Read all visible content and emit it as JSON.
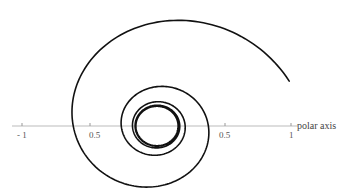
{
  "chart_data": {
    "type": "line",
    "subtype": "polar-spiral",
    "title": "",
    "xlabel": "polar axis",
    "ylabel": "",
    "ticks": [
      {
        "value": -1,
        "label": "- 1"
      },
      {
        "value": -0.5,
        "label": "0.5"
      },
      {
        "value": 0.5,
        "label": "0.5"
      },
      {
        "value": 1,
        "label": "1"
      }
    ],
    "xlim": [
      -1.05,
      1.05
    ],
    "grid": false,
    "legend": null,
    "series": [
      {
        "name": "spiral",
        "color": "#111111",
        "r_start": 1.0,
        "theta_start_deg": 20,
        "r_limit": 0.15,
        "turns": 8
      }
    ]
  },
  "axis": {
    "label": "polar axis",
    "color": "#bbbbbb"
  },
  "colors": {
    "curve": "#111111",
    "axis": "#bbbbbb",
    "text": "#555555"
  }
}
